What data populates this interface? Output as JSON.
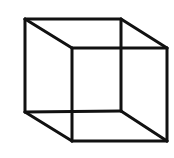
{
  "diagram": {
    "type": "wireframe-cube",
    "background": "#ffffff",
    "stroke_color": "#111111",
    "stroke_width": 3,
    "vertices": {
      "back_top_left": [
        25,
        19
      ],
      "back_top_right": [
        121,
        19
      ],
      "back_bottom_left": [
        25,
        112
      ],
      "back_bottom_right": [
        121,
        111
      ],
      "front_top_left": [
        72,
        48
      ],
      "front_top_right": [
        167,
        48
      ],
      "front_bottom_left": [
        72,
        141
      ],
      "front_bottom_right": [
        167,
        141
      ]
    },
    "edges": [
      [
        "back_top_left",
        "back_top_right"
      ],
      [
        "back_top_right",
        "back_bottom_right"
      ],
      [
        "back_bottom_right",
        "back_bottom_left"
      ],
      [
        "back_bottom_left",
        "back_top_left"
      ],
      [
        "front_top_left",
        "front_top_right"
      ],
      [
        "front_top_right",
        "front_bottom_right"
      ],
      [
        "front_bottom_right",
        "front_bottom_left"
      ],
      [
        "front_bottom_left",
        "front_top_left"
      ],
      [
        "back_top_left",
        "front_top_left"
      ],
      [
        "back_top_right",
        "front_top_right"
      ],
      [
        "back_bottom_left",
        "front_bottom_left"
      ],
      [
        "back_bottom_right",
        "front_bottom_right"
      ]
    ]
  }
}
